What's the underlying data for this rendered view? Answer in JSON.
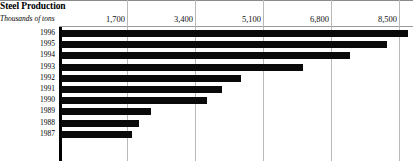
{
  "header": {
    "title": "Steel Production",
    "subtitle": "Thousands of tons"
  },
  "axis": {
    "tick_labels": [
      "1,700",
      "3,400",
      "5,100",
      "6,800",
      "8,500"
    ]
  },
  "chart_data": {
    "type": "bar",
    "orientation": "horizontal",
    "title": "Steel Production",
    "subtitle": "Thousands of tons",
    "xlabel": "Thousands of tons",
    "ylabel": "",
    "xlim": [
      0,
      8725
    ],
    "xticks": [
      1700,
      3400,
      5100,
      6800,
      8500
    ],
    "xtick_labels": [
      "1,700",
      "3,400",
      "5,100",
      "6,800",
      "8,500"
    ],
    "grid": true,
    "legend": false,
    "bar_color": "#0a0a0a",
    "categories": [
      "1996",
      "1995",
      "1994",
      "1993",
      "1992",
      "1991",
      "1990",
      "1989",
      "1988",
      "1987"
    ],
    "values": [
      8725,
      8200,
      7275,
      6100,
      4550,
      4075,
      3700,
      2300,
      2000,
      1825
    ]
  }
}
